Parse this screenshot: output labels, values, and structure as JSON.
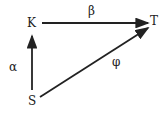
{
  "nodes": {
    "K": "K",
    "T": "T",
    "S": "S"
  },
  "edges": {
    "alpha": "α",
    "beta": "β",
    "phi": "φ"
  },
  "colors": {
    "ink": "#222222"
  }
}
